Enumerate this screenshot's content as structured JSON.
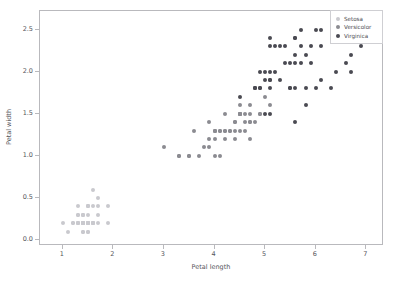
{
  "chart_data": {
    "type": "scatter",
    "title": "",
    "xlabel": "Petal length",
    "ylabel": "Petal width",
    "xlim": [
      0.55,
      7.35
    ],
    "ylim": [
      -0.07,
      2.72
    ],
    "xticks": [
      "1",
      "2",
      "3",
      "4",
      "5",
      "6",
      "7"
    ],
    "xtick_values": [
      1,
      2,
      3,
      4,
      5,
      6,
      7
    ],
    "yticks": [
      "0.0",
      "0.5",
      "1.0",
      "1.5",
      "2.0",
      "2.5"
    ],
    "ytick_values": [
      0.0,
      0.5,
      1.0,
      1.5,
      2.0,
      2.5
    ],
    "grid": false,
    "legend_position": "upper right",
    "series": [
      {
        "name": "Setosa",
        "color": "#c9c9ce",
        "points": [
          [
            1.4,
            0.2
          ],
          [
            1.4,
            0.2
          ],
          [
            1.3,
            0.2
          ],
          [
            1.5,
            0.2
          ],
          [
            1.4,
            0.2
          ],
          [
            1.7,
            0.4
          ],
          [
            1.4,
            0.3
          ],
          [
            1.5,
            0.2
          ],
          [
            1.4,
            0.2
          ],
          [
            1.5,
            0.1
          ],
          [
            1.5,
            0.2
          ],
          [
            1.6,
            0.2
          ],
          [
            1.4,
            0.1
          ],
          [
            1.1,
            0.1
          ],
          [
            1.2,
            0.2
          ],
          [
            1.5,
            0.4
          ],
          [
            1.3,
            0.4
          ],
          [
            1.4,
            0.3
          ],
          [
            1.7,
            0.3
          ],
          [
            1.5,
            0.3
          ],
          [
            1.7,
            0.2
          ],
          [
            1.5,
            0.4
          ],
          [
            1.0,
            0.2
          ],
          [
            1.7,
            0.5
          ],
          [
            1.9,
            0.2
          ],
          [
            1.6,
            0.2
          ],
          [
            1.6,
            0.4
          ],
          [
            1.5,
            0.2
          ],
          [
            1.4,
            0.2
          ],
          [
            1.6,
            0.2
          ],
          [
            1.6,
            0.2
          ],
          [
            1.5,
            0.4
          ],
          [
            1.5,
            0.1
          ],
          [
            1.4,
            0.2
          ],
          [
            1.5,
            0.2
          ],
          [
            1.2,
            0.2
          ],
          [
            1.3,
            0.2
          ],
          [
            1.4,
            0.1
          ],
          [
            1.3,
            0.2
          ],
          [
            1.5,
            0.2
          ],
          [
            1.3,
            0.3
          ],
          [
            1.3,
            0.3
          ],
          [
            1.3,
            0.2
          ],
          [
            1.6,
            0.6
          ],
          [
            1.9,
            0.4
          ],
          [
            1.4,
            0.3
          ],
          [
            1.6,
            0.2
          ],
          [
            1.4,
            0.2
          ],
          [
            1.5,
            0.2
          ],
          [
            1.4,
            0.2
          ]
        ]
      },
      {
        "name": "Versicolor",
        "color": "#8b8b91",
        "points": [
          [
            4.7,
            1.4
          ],
          [
            4.5,
            1.5
          ],
          [
            4.9,
            1.5
          ],
          [
            4.0,
            1.3
          ],
          [
            4.6,
            1.5
          ],
          [
            4.5,
            1.3
          ],
          [
            4.7,
            1.6
          ],
          [
            3.3,
            1.0
          ],
          [
            4.6,
            1.3
          ],
          [
            3.9,
            1.4
          ],
          [
            3.5,
            1.0
          ],
          [
            4.2,
            1.5
          ],
          [
            4.0,
            1.0
          ],
          [
            4.7,
            1.4
          ],
          [
            3.6,
            1.3
          ],
          [
            4.4,
            1.4
          ],
          [
            4.5,
            1.5
          ],
          [
            4.1,
            1.0
          ],
          [
            4.5,
            1.5
          ],
          [
            3.9,
            1.1
          ],
          [
            4.8,
            1.8
          ],
          [
            4.0,
            1.3
          ],
          [
            4.9,
            1.5
          ],
          [
            4.7,
            1.2
          ],
          [
            4.3,
            1.3
          ],
          [
            4.4,
            1.4
          ],
          [
            4.8,
            1.4
          ],
          [
            5.0,
            1.7
          ],
          [
            4.5,
            1.5
          ],
          [
            3.5,
            1.0
          ],
          [
            3.8,
            1.1
          ],
          [
            3.7,
            1.0
          ],
          [
            3.9,
            1.2
          ],
          [
            5.1,
            1.6
          ],
          [
            4.5,
            1.5
          ],
          [
            4.5,
            1.6
          ],
          [
            4.7,
            1.5
          ],
          [
            4.4,
            1.3
          ],
          [
            4.1,
            1.3
          ],
          [
            4.0,
            1.3
          ],
          [
            4.4,
            1.2
          ],
          [
            4.6,
            1.4
          ],
          [
            4.0,
            1.2
          ],
          [
            3.3,
            1.0
          ],
          [
            4.2,
            1.3
          ],
          [
            4.2,
            1.2
          ],
          [
            4.2,
            1.3
          ],
          [
            4.3,
            1.3
          ],
          [
            3.0,
            1.1
          ],
          [
            4.1,
            1.3
          ]
        ]
      },
      {
        "name": "Virginica",
        "color": "#4a4a52",
        "points": [
          [
            6.0,
            2.5
          ],
          [
            5.1,
            1.9
          ],
          [
            5.9,
            2.1
          ],
          [
            5.6,
            1.8
          ],
          [
            5.8,
            2.2
          ],
          [
            6.6,
            2.1
          ],
          [
            4.5,
            1.7
          ],
          [
            6.3,
            1.8
          ],
          [
            5.8,
            1.8
          ],
          [
            6.1,
            2.5
          ],
          [
            5.1,
            2.0
          ],
          [
            5.3,
            1.9
          ],
          [
            5.5,
            2.1
          ],
          [
            5.0,
            2.0
          ],
          [
            5.1,
            2.4
          ],
          [
            5.3,
            2.3
          ],
          [
            5.5,
            1.8
          ],
          [
            6.7,
            2.2
          ],
          [
            6.9,
            2.3
          ],
          [
            5.0,
            1.5
          ],
          [
            5.7,
            2.3
          ],
          [
            4.9,
            2.0
          ],
          [
            6.7,
            2.0
          ],
          [
            4.9,
            1.8
          ],
          [
            5.7,
            2.1
          ],
          [
            6.0,
            1.8
          ],
          [
            4.8,
            1.8
          ],
          [
            4.9,
            1.8
          ],
          [
            5.6,
            2.1
          ],
          [
            5.8,
            1.6
          ],
          [
            6.1,
            1.9
          ],
          [
            6.4,
            2.0
          ],
          [
            5.6,
            2.2
          ],
          [
            5.1,
            1.5
          ],
          [
            5.6,
            1.4
          ],
          [
            6.1,
            2.3
          ],
          [
            5.6,
            2.4
          ],
          [
            5.5,
            1.8
          ],
          [
            4.8,
            1.8
          ],
          [
            5.4,
            2.1
          ],
          [
            5.6,
            2.4
          ],
          [
            5.1,
            2.3
          ],
          [
            5.1,
            1.9
          ],
          [
            5.9,
            2.3
          ],
          [
            5.7,
            2.5
          ],
          [
            5.2,
            2.3
          ],
          [
            5.0,
            1.9
          ],
          [
            5.2,
            2.0
          ],
          [
            5.4,
            2.3
          ],
          [
            5.1,
            1.8
          ]
        ]
      }
    ]
  }
}
